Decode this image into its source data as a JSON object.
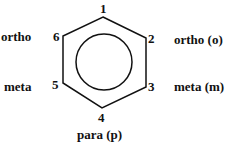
{
  "diagram": {
    "positions": [
      {
        "number": "1",
        "label": ""
      },
      {
        "number": "2",
        "label": "ortho (o)"
      },
      {
        "number": "3",
        "label": "meta (m)"
      },
      {
        "number": "4",
        "label": "para (p)"
      },
      {
        "number": "5",
        "label": "meta"
      },
      {
        "number": "6",
        "label": "ortho"
      }
    ]
  }
}
